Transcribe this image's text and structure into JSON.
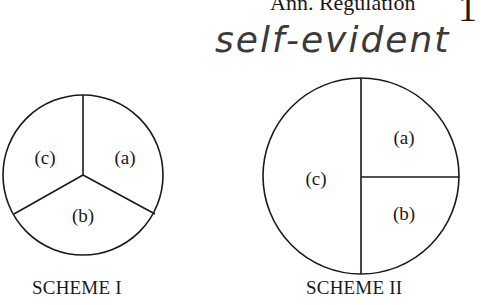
{
  "header": {
    "text": "Ann.   Regulation",
    "page_mark": "1"
  },
  "annotation": {
    "handwritten_text": "self-evident"
  },
  "schemes": [
    {
      "caption": "SCHEME I",
      "layout": "circle divided into three 120-degree sectors",
      "sectors": [
        {
          "label": "(a)",
          "position": "upper-right"
        },
        {
          "label": "(b)",
          "position": "bottom"
        },
        {
          "label": "(c)",
          "position": "upper-left"
        }
      ]
    },
    {
      "caption": "SCHEME II",
      "layout": "circle split vertically in half; right half split horizontally",
      "sectors": [
        {
          "label": "(a)",
          "position": "upper-right quarter"
        },
        {
          "label": "(b)",
          "position": "lower-right quarter"
        },
        {
          "label": "(c)",
          "position": "left half"
        }
      ]
    }
  ],
  "colors": {
    "line": "#1a1a1a",
    "ink": "#3a3a3a",
    "background": "#ffffff"
  }
}
